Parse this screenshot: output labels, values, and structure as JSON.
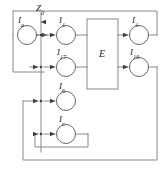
{
  "diagram": {
    "type": "block-diagram",
    "title": "",
    "canvas": {
      "width": 165,
      "height": 173
    },
    "colors": {
      "stroke": "#7a7a7a",
      "node_stroke": "#555555",
      "text": "#1a1a1a",
      "background": "#ffffff"
    },
    "input_signal": {
      "name": "Z0",
      "label_letter": "Z",
      "label_sub": "0"
    },
    "process_block": {
      "name": "E",
      "label": "E"
    },
    "nodes": [
      {
        "id": "Ia",
        "label_letter": "I",
        "label_sub": "a",
        "cx": 27,
        "cy": 35,
        "r": 9.5
      },
      {
        "id": "I1",
        "label_letter": "I",
        "label_sub": "1",
        "cx": 66,
        "cy": 35,
        "r": 9.5
      },
      {
        "id": "I17",
        "label_letter": "I",
        "label_sub": "17",
        "cx": 66,
        "cy": 67,
        "r": 9.5
      },
      {
        "id": "I6",
        "label_letter": "I",
        "label_sub": "6",
        "cx": 66,
        "cy": 101,
        "r": 9.5
      },
      {
        "id": "Ic",
        "label_letter": "I",
        "label_sub": "c",
        "cx": 66,
        "cy": 134,
        "r": 9.5
      },
      {
        "id": "I4",
        "label_letter": "I",
        "label_sub": "4",
        "cx": 139,
        "cy": 35,
        "r": 9.5
      },
      {
        "id": "I19",
        "label_letter": "I",
        "label_sub": "19",
        "cx": 139,
        "cy": 67,
        "r": 9.5
      }
    ],
    "labels": {
      "Z0": {
        "text": "Z",
        "sub": "0",
        "x": 36,
        "y": 9
      },
      "Ia": {
        "text": "I",
        "sub": "a",
        "x": 18,
        "y": 19
      },
      "I1": {
        "text": "I",
        "sub": "1",
        "x": 58,
        "y": 19
      },
      "I17": {
        "text": "I",
        "sub": "17",
        "x": 57,
        "y": 51
      },
      "I6": {
        "text": "I",
        "sub": "6",
        "x": 58,
        "y": 85
      },
      "Ic": {
        "text": "I",
        "sub": "c",
        "x": 58,
        "y": 118
      },
      "I4": {
        "text": "I",
        "sub": "4",
        "x": 131,
        "y": 19
      },
      "I19": {
        "text": "I",
        "sub": "19",
        "x": 130,
        "y": 51
      },
      "E": {
        "text": "E",
        "x": 98,
        "y": 50
      }
    }
  }
}
